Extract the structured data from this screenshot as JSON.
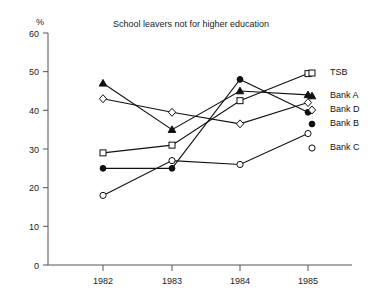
{
  "chart_data": {
    "type": "line",
    "title": "School leavers not for higher education",
    "xlabel": "",
    "ylabel": "%",
    "categories": [
      "1982",
      "1983",
      "1984",
      "1985"
    ],
    "x": [
      1982,
      1983,
      1984,
      1985
    ],
    "ylim": [
      0,
      60
    ],
    "yticks": [
      0,
      10,
      20,
      30,
      40,
      50,
      60
    ],
    "ytick_labels": [
      "0",
      "10",
      "20",
      "30",
      "40",
      "50",
      "60"
    ],
    "grid": false,
    "legend_position": "right",
    "series": [
      {
        "name": "TSB",
        "marker": "open-square",
        "values": [
          29,
          31,
          42.5,
          49.5
        ]
      },
      {
        "name": "Bank A",
        "marker": "filled-triangle",
        "values": [
          47,
          35,
          45,
          44
        ]
      },
      {
        "name": "Bank D",
        "marker": "open-diamond",
        "values": [
          43,
          39.5,
          36.5,
          42
        ]
      },
      {
        "name": "Bank B",
        "marker": "filled-circle",
        "values": [
          25,
          25,
          48,
          39.5
        ]
      },
      {
        "name": "Bank C",
        "marker": "open-circle",
        "values": [
          18,
          27,
          26,
          34
        ]
      }
    ]
  },
  "legend": {
    "entries": [
      {
        "label": "TSB",
        "y": 73
      },
      {
        "label": "Bank A",
        "y": 96
      },
      {
        "label": "Bank D",
        "y": 110
      },
      {
        "label": "Bank B",
        "y": 124
      },
      {
        "label": "Bank C",
        "y": 148
      }
    ]
  },
  "colors": {
    "ink": "#111111",
    "axis": "#555555",
    "background": "#ffffff"
  }
}
